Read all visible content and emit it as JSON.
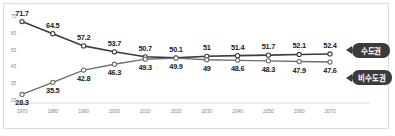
{
  "chart_data": {
    "type": "line",
    "title": "",
    "subtitle": "",
    "xlabel": "",
    "ylabel": "",
    "grid": false,
    "legend_position": "right",
    "xlim": [
      1970,
      2070
    ],
    "ylim": [
      25,
      75
    ],
    "categories": [
      "1970",
      "1980",
      "1990",
      "2000",
      "2010",
      "2020",
      "2030",
      "2040",
      "2050",
      "2060",
      "2070"
    ],
    "yticks": [
      "75",
      "65",
      "55",
      "45",
      "35",
      "25"
    ],
    "ytick_values": [
      75,
      65,
      55,
      45,
      35,
      25
    ],
    "series": [
      {
        "name": "수도권",
        "color": "#3b3b3b",
        "marker": "circle-open",
        "values": [
          71.7,
          64.5,
          57.2,
          53.7,
          50.7,
          50.1,
          51,
          51.4,
          51.7,
          52.1,
          52.4
        ],
        "labels": [
          "71.7",
          "64.5",
          "57.2",
          "53.7",
          "50.7",
          "50.1",
          "51",
          "51.4",
          "51.7",
          "52.1",
          "52.4"
        ]
      },
      {
        "name": "비수도권",
        "color": "#6e6e6e",
        "marker": "circle-open",
        "values": [
          28.3,
          35.5,
          42.8,
          46.3,
          49.3,
          49.9,
          49,
          48.6,
          48.3,
          47.9,
          47.6
        ],
        "labels": [
          "28.3",
          "35.5",
          "42.8",
          "46.3",
          "49.3",
          "49.9",
          "49",
          "48.6",
          "48.3",
          "47.9",
          "47.6"
        ]
      }
    ]
  },
  "legend": {
    "upper": {
      "label": "수도권",
      "color": "#3b3b3b"
    },
    "lower": {
      "label": "비수도권",
      "color": "#3b3b3b"
    }
  }
}
